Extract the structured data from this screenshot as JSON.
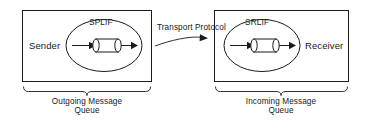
{
  "diagram": {
    "stroke_color": "#1a1a1a",
    "background_color": "#ffffff",
    "left_box": {
      "node_label": "Sender",
      "interface_label": "SPLIF",
      "queue_label_line1": "Outgoing Message",
      "queue_label_line2": "Queue"
    },
    "right_box": {
      "node_label": "Receiver",
      "interface_label": "SRLIF",
      "queue_label_line1": "Incoming Message",
      "queue_label_line2": "Queue"
    },
    "link": {
      "label_line1": "Transport",
      "label_line2": "Protocol",
      "direction": "left-to-right"
    }
  }
}
